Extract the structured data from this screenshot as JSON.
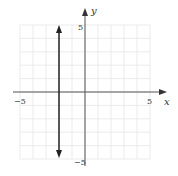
{
  "chart_data": {
    "type": "line",
    "title": "",
    "xlabel": "x",
    "ylabel": "y",
    "xlim": [
      -5,
      5
    ],
    "ylim": [
      -5,
      5
    ],
    "grid": true,
    "x_tick_labels": [
      "-5",
      "5"
    ],
    "y_tick_labels": [
      "5",
      "-5"
    ],
    "series": [
      {
        "name": "vertical line x = -2",
        "equation": "x = -2",
        "points": [
          {
            "x": -2,
            "y": 5
          },
          {
            "x": -2,
            "y": -5
          }
        ],
        "arrows": "both"
      }
    ]
  },
  "labels": {
    "x_axis": "x",
    "y_axis": "y",
    "x_min": "−5",
    "x_max": "5",
    "y_max": "5",
    "y_min": "−5"
  },
  "colors": {
    "grid": "#e6e6e6",
    "axis": "#555555",
    "line": "#222222"
  }
}
